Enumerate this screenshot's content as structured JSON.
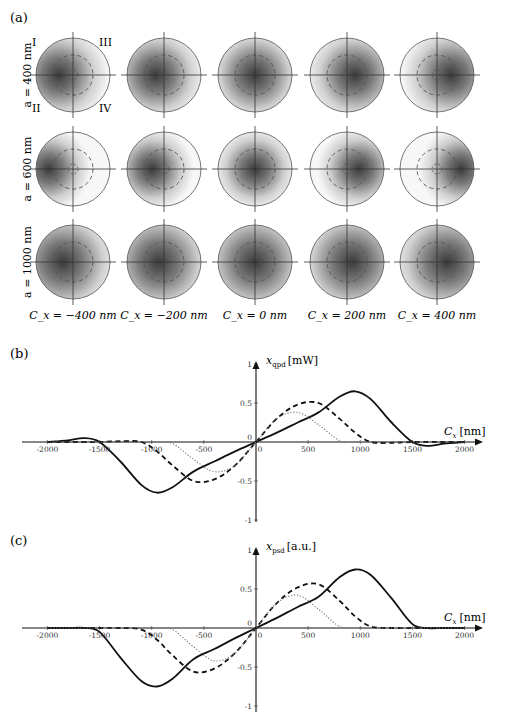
{
  "figure": {
    "panel_a": {
      "label": "(a)",
      "row_labels": [
        "a = 400 nm",
        "a = 600 nm",
        "a = 1000 nm"
      ],
      "col_labels": [
        "C_x = −400 nm",
        "C_x = −200 nm",
        "C_x = 0 nm",
        "C_x = 200 nm",
        "C_x = 400 nm"
      ],
      "quadrant_labels": [
        "I",
        "III",
        "II",
        "IV"
      ],
      "grid": {
        "col_centers_x": [
          73,
          164,
          255,
          347,
          437
        ],
        "row_centers_y": [
          75,
          169,
          262
        ],
        "radius": 37,
        "dashed_radius": 20,
        "inner_dashed_radius": 5,
        "spot_offset_x": [
          [
            -14,
            -8,
            0,
            8,
            14
          ],
          [
            -24,
            -12,
            0,
            12,
            24
          ],
          [
            -10,
            -5,
            0,
            5,
            10
          ]
        ],
        "spot_sigma": [
          [
            26,
            26,
            26,
            26,
            26
          ],
          [
            22,
            22,
            22,
            22,
            22
          ],
          [
            30,
            30,
            30,
            30,
            30
          ]
        ]
      }
    },
    "panel_b": {
      "label": "(b)",
      "ylabel_main": "x",
      "ylabel_sub": "qpd",
      "ylabel_unit": "[mW]",
      "xlabel_main": "C",
      "xlabel_sub": "x",
      "xlabel_unit": "[nm]"
    },
    "panel_c": {
      "label": "(c)",
      "ylabel_main": "x",
      "ylabel_sub": "psd",
      "ylabel_unit": "[a.u.]",
      "xlabel_main": "C",
      "xlabel_sub": "x",
      "xlabel_unit": "[nm]"
    }
  },
  "chart_data": [
    {
      "panel": "(b)",
      "type": "line",
      "title": "",
      "xlabel": "C_x [nm]",
      "ylabel": "x_qpd [mW]",
      "xlim": [
        -2200,
        2200
      ],
      "ylim": [
        -1,
        1
      ],
      "xticks": [
        -2000,
        -1500,
        -1000,
        -500,
        0,
        500,
        1000,
        1500,
        2000
      ],
      "yticks": [
        -1,
        -0.5,
        0,
        0.5,
        1
      ],
      "grid": false,
      "legend": null,
      "x": [
        -2000,
        -1800,
        -1650,
        -1500,
        -1300,
        -1100,
        -950,
        -800,
        -600,
        -400,
        -200,
        0,
        200,
        400,
        600,
        800,
        950,
        1100,
        1300,
        1500,
        1650,
        1800,
        2000
      ],
      "series": [
        {
          "name": "a = 1000 nm",
          "style": "solid",
          "values": [
            0,
            0.02,
            0.05,
            0.0,
            -0.25,
            -0.55,
            -0.65,
            -0.58,
            -0.38,
            -0.25,
            -0.12,
            0,
            0.12,
            0.25,
            0.38,
            0.58,
            0.65,
            0.55,
            0.25,
            0.0,
            -0.05,
            -0.02,
            0
          ]
        },
        {
          "name": "a = 600 nm",
          "style": "dashed",
          "values": [
            0,
            0,
            0,
            0,
            0.01,
            0,
            -0.12,
            -0.3,
            -0.5,
            -0.48,
            -0.3,
            0,
            0.3,
            0.48,
            0.5,
            0.3,
            0.12,
            0,
            -0.01,
            0,
            0,
            0,
            0
          ]
        },
        {
          "name": "a = 400 nm",
          "style": "dotted",
          "values": [
            0,
            0,
            0,
            0,
            0,
            0,
            0,
            -0.02,
            -0.22,
            -0.38,
            -0.3,
            0,
            0.3,
            0.38,
            0.22,
            0.02,
            0,
            0,
            0,
            0,
            0,
            0,
            0
          ]
        }
      ]
    },
    {
      "panel": "(c)",
      "type": "line",
      "title": "",
      "xlabel": "C_x [nm]",
      "ylabel": "x_psd [a.u.]",
      "xlim": [
        -2200,
        2200
      ],
      "ylim": [
        -1,
        1
      ],
      "xticks": [
        -2000,
        -1500,
        -1000,
        -500,
        0,
        500,
        1000,
        1500,
        2000
      ],
      "yticks": [
        -1,
        -0.5,
        0,
        0.5,
        1
      ],
      "grid": false,
      "legend": null,
      "x": [
        -2000,
        -1800,
        -1650,
        -1500,
        -1300,
        -1100,
        -950,
        -800,
        -600,
        -400,
        -200,
        0,
        200,
        400,
        600,
        800,
        950,
        1100,
        1300,
        1500,
        1650,
        1800,
        2000
      ],
      "series": [
        {
          "name": "a = 1000 nm",
          "style": "solid",
          "values": [
            0,
            0,
            0,
            -0.05,
            -0.38,
            -0.68,
            -0.75,
            -0.65,
            -0.4,
            -0.27,
            -0.13,
            0,
            0.13,
            0.27,
            0.4,
            0.65,
            0.75,
            0.68,
            0.38,
            0.05,
            0,
            0,
            0
          ]
        },
        {
          "name": "a = 600 nm",
          "style": "dashed",
          "values": [
            0,
            0,
            0,
            0,
            0,
            -0.02,
            -0.15,
            -0.35,
            -0.56,
            -0.52,
            -0.32,
            0,
            0.32,
            0.52,
            0.56,
            0.35,
            0.15,
            0.02,
            0,
            0,
            0,
            0,
            0
          ]
        },
        {
          "name": "a = 400 nm",
          "style": "dotted",
          "values": [
            0,
            0,
            0,
            0,
            0,
            0,
            0,
            -0.02,
            -0.24,
            -0.42,
            -0.32,
            0,
            0.32,
            0.42,
            0.24,
            0.02,
            0,
            0,
            0,
            0,
            0,
            0,
            0
          ]
        }
      ]
    }
  ]
}
